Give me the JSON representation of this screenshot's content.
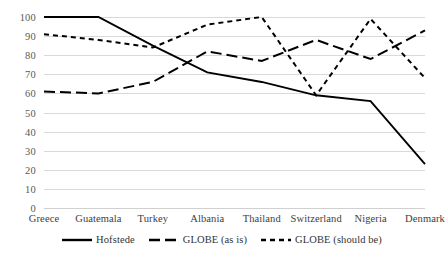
{
  "chart_data": {
    "type": "line",
    "title": "",
    "subtitle": "",
    "xlabel": "",
    "ylabel": "",
    "categories": [
      "Greece",
      "Guatemala",
      "Turkey",
      "Albania",
      "Thailand",
      "Switzerland",
      "Nigeria",
      "Denmark"
    ],
    "ylim": [
      0,
      100
    ],
    "ytick_labels": [
      "100",
      "90",
      "80",
      "70",
      "60",
      "50",
      "40",
      "30",
      "20",
      "10",
      "0"
    ],
    "ytick_values": [
      100,
      90,
      80,
      70,
      60,
      50,
      40,
      30,
      20,
      10,
      0
    ],
    "grid": true,
    "legend_position": "bottom-center",
    "series": [
      {
        "name": "Hofstede",
        "style": "solid",
        "color": "#000000",
        "values": [
          100,
          100,
          85,
          71,
          66,
          59,
          56,
          23
        ]
      },
      {
        "name": "GLOBE (as is)",
        "style": "long-dash",
        "color": "#000000",
        "values": [
          61,
          60,
          66,
          82,
          77,
          88,
          78,
          93
        ]
      },
      {
        "name": "GLOBE (should be)",
        "style": "short-dash",
        "color": "#000000",
        "values": [
          91,
          88,
          84,
          96,
          100,
          59,
          99,
          68
        ]
      }
    ]
  },
  "legend": {
    "items": [
      {
        "label": "Hofstede",
        "style": "solid"
      },
      {
        "label": "GLOBE (as is)",
        "style": "long-dash"
      },
      {
        "label": "GLOBE (should be)",
        "style": "short-dash"
      }
    ]
  },
  "colors": {
    "gridline": "#d9d9d9",
    "series": "#000000",
    "tick_text": "#595959",
    "category_text": "#404040",
    "background": "#ffffff"
  }
}
